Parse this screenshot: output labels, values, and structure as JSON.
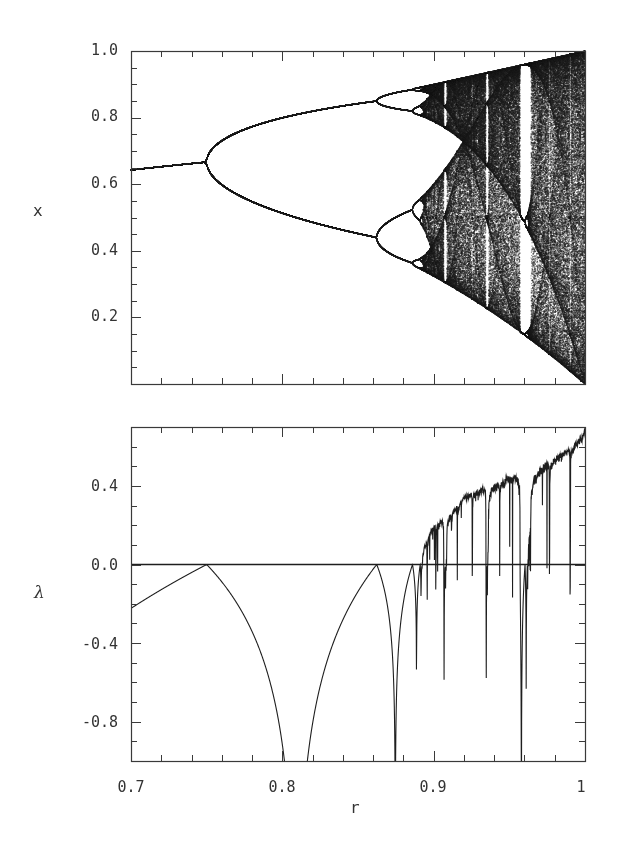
{
  "chart_data": [
    {
      "type": "scatter",
      "title": "",
      "description": "Bifurcation diagram of the logistic map x -> 4 r x (1 - x)",
      "xlabel": "r",
      "ylabel": "x",
      "xlim": [
        0.7,
        1.0
      ],
      "ylim": [
        0.0,
        1.0
      ],
      "x_ticks": [
        0.7,
        0.8,
        0.9,
        1.0
      ],
      "x_tick_labels": [],
      "y_ticks": [
        0.2,
        0.4,
        0.6,
        0.8,
        1.0
      ],
      "y_tick_labels": [
        "0.2",
        "0.4",
        "0.6",
        "0.8",
        "1.0"
      ],
      "minor_x_step": 0.02,
      "minor_y_step": 0.05,
      "grid": false,
      "map": "4*r*x*(1-x)",
      "features": {
        "period_2_bifurcation_r": 0.75,
        "period_4_bifurcation_r": 0.862,
        "period_8_bifurcation_r": 0.886,
        "onset_of_chaos_r": 0.892,
        "period_3_window_r": [
          0.957,
          0.962
        ],
        "fixed_point_at_r_0_7": 0.643,
        "fixed_point_at_r_0_75": 0.667
      }
    },
    {
      "type": "line",
      "title": "",
      "description": "Lyapunov exponent of the logistic map vs r",
      "xlabel": "r",
      "ylabel": "λ",
      "xlim": [
        0.7,
        1.0
      ],
      "ylim": [
        -1.0,
        0.7
      ],
      "x_ticks": [
        0.7,
        0.8,
        0.9,
        1.0
      ],
      "x_tick_labels": [
        "0.7",
        "0.8",
        "0.9",
        "1"
      ],
      "y_ticks": [
        -0.8,
        -0.4,
        0.0,
        0.4
      ],
      "y_tick_labels": [
        "-0.8",
        "-0.4",
        "0.0",
        "0.4"
      ],
      "minor_x_step": 0.02,
      "minor_y_step": 0.1,
      "grid": false,
      "reference_line": {
        "y": 0.0
      },
      "key_points": [
        {
          "r": 0.7,
          "lambda": -0.22
        },
        {
          "r": 0.75,
          "lambda": 0.0
        },
        {
          "r": 0.8,
          "lambda": -1.0
        },
        {
          "r": 0.809,
          "lambda": "-inf (superstable)"
        },
        {
          "r": 0.862,
          "lambda": 0.0
        },
        {
          "r": 0.875,
          "lambda": -1.0
        },
        {
          "r": 0.886,
          "lambda": 0.0
        },
        {
          "r": 0.9,
          "lambda": 0.15
        },
        {
          "r": 0.95,
          "lambda": 0.32
        },
        {
          "r": 0.957,
          "lambda": -1.0
        },
        {
          "r": 1.0,
          "lambda": 0.69
        }
      ]
    }
  ],
  "labels": {
    "top_ylabel": "x",
    "bottom_ylabel": "λ",
    "xlabel": "r",
    "top_yticks": [
      "1.0",
      "0.8",
      "0.6",
      "0.4",
      "0.2"
    ],
    "bottom_yticks": [
      "0.4",
      "0.0",
      "-0.4",
      "-0.8"
    ],
    "xticks": [
      "0.7",
      "0.8",
      "0.9",
      "1"
    ]
  },
  "style": {
    "ink": "#1e1e1e",
    "frame": "#3a3a3a",
    "background": "#ffffff"
  }
}
